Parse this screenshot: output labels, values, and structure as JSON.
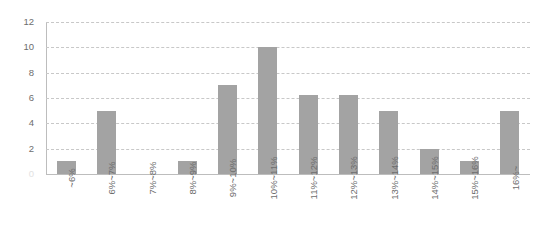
{
  "chart_data": {
    "type": "bar",
    "title": "",
    "subtitle": "",
    "xlabel": "",
    "ylabel": "",
    "categories": [
      "~6%",
      "6%~7%",
      "7%~8%",
      "8%~9%",
      "9%~10%",
      "10%~11%",
      "11%~12%",
      "12%~13%",
      "13%~14%",
      "14%~15%",
      "15%~16%",
      "16%~"
    ],
    "values": [
      1,
      5,
      0,
      1,
      7,
      10,
      6.2,
      6.2,
      5,
      2,
      1,
      5
    ],
    "ylim": [
      0,
      12
    ],
    "ytick_values": [
      0,
      2,
      4,
      6,
      8,
      10,
      12
    ],
    "ytick_labels": [
      "0",
      "2",
      "4",
      "6",
      "8",
      "10",
      "12"
    ],
    "grid": true,
    "grid_axis": "y",
    "grid_style": "dashed",
    "legend": false,
    "legend_position": "none",
    "bar_color": "#a3a3a3",
    "grid_color": "#c8c8c8",
    "axis_color": "#bdbdbd",
    "text_color": "#6d6d6d",
    "background_color": "#ffffff",
    "xtick_rotation": 90
  }
}
